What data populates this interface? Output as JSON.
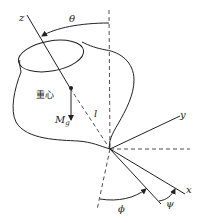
{
  "diagram": {
    "type": "rigid body rotation / Euler angles",
    "labels": {
      "z_axis": "z",
      "y_axis": "y",
      "x_axis": "x",
      "theta": "θ",
      "phi": "ϕ",
      "psi": "ψ",
      "center_of_gravity": "重心",
      "gravity_moment": "M",
      "gravity_moment_sub": "g",
      "length": "l"
    },
    "colors": {
      "line": "#222222",
      "background": "#ffffff"
    }
  }
}
